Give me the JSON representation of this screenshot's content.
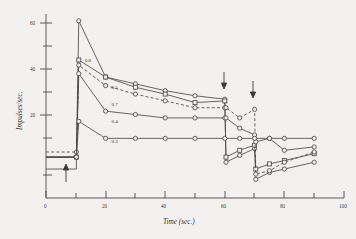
{
  "figure": {
    "kind": "scanned-scientific-plot",
    "background_color": "#f2f1ef",
    "ink_color": "#4a4a48"
  },
  "chart_data": {
    "type": "line",
    "title": "",
    "subtitle": "",
    "xlabel": "Time (sec.)",
    "ylabel": "Impulses/sec.",
    "xlim": [
      0,
      100
    ],
    "ylim": [
      8,
      62
    ],
    "grid": false,
    "legend_position": "inline-labels",
    "x_ticks_major": [
      0,
      20,
      40,
      60,
      80,
      100
    ],
    "x_ticks_minor": [
      10,
      30,
      50,
      70,
      90
    ],
    "x_tick_labels": [
      "0",
      "20",
      "40",
      "60",
      "80",
      "100"
    ],
    "y_ticks_major": [
      20,
      40,
      60
    ],
    "y_ticks_minor": [
      10,
      30,
      50
    ],
    "y_tick_labels": [
      "20",
      "40",
      "60"
    ],
    "annotations": [
      {
        "name": "stimulus-on-arrow",
        "label": "",
        "direction": "up",
        "x": 11,
        "y": 12
      },
      {
        "name": "step-down-arrow-1",
        "label": "",
        "direction": "down",
        "x": 60,
        "y": 44
      },
      {
        "name": "step-down-arrow-2",
        "label": "",
        "direction": "down",
        "x": 70,
        "y": 41
      }
    ],
    "series": [
      {
        "name": "0.8",
        "label": "0.8",
        "style": "solid",
        "marker": "circle",
        "label_x": 13,
        "label_y": 48,
        "x": [
          0,
          5,
          10.2,
          11,
          20,
          30,
          40,
          50,
          60,
          60.4,
          65,
          70,
          70.4,
          75,
          80,
          90
        ],
        "y": [
          20,
          20,
          20,
          60,
          43.5,
          41.5,
          39.5,
          38,
          37,
          18.5,
          20.5,
          22.5,
          13.5,
          15.5,
          16.5,
          18.5
        ]
      },
      {
        "name": "0.5",
        "label": "0.5",
        "style": "solid",
        "marker": "square",
        "label_x": 22,
        "label_y": 40,
        "x": [
          0,
          5,
          10.2,
          11,
          20,
          30,
          40,
          50,
          60,
          60.4,
          65,
          70,
          70.4,
          75,
          80,
          90
        ],
        "y": [
          20,
          20,
          20,
          48.5,
          43.5,
          40.5,
          38.5,
          36,
          36.5,
          20,
          22,
          23.5,
          16.5,
          18,
          19,
          21
        ]
      },
      {
        "name": "0.7",
        "label": "0.7",
        "style": "dashed",
        "marker": "circle",
        "label_x": 22,
        "label_y": 35,
        "x": [
          0,
          5,
          10.2,
          11,
          20,
          30,
          40,
          50,
          60,
          60.4,
          65,
          70,
          70.4,
          75,
          80,
          90
        ],
        "y": [
          21.5,
          21.5,
          21.5,
          47,
          41,
          38.5,
          36.5,
          34.5,
          34.5,
          34.5,
          31.5,
          34,
          15,
          16,
          18.5,
          21.5
        ]
      },
      {
        "name": "0.4",
        "label": "0.4",
        "style": "solid",
        "marker": "circle",
        "label_x": 22,
        "label_y": 30,
        "x": [
          0,
          5,
          10.2,
          11,
          20,
          30,
          40,
          50,
          60,
          60.4,
          65,
          70,
          70.4,
          75,
          80,
          90
        ],
        "y": [
          20,
          20,
          20,
          44.5,
          33.5,
          32.5,
          31.5,
          31.5,
          31.5,
          31.5,
          28.5,
          26.5,
          24.5,
          25.5,
          22,
          23
        ]
      },
      {
        "name": "0.3",
        "label": "0.3",
        "style": "solid",
        "marker": "circle",
        "label_x": 22,
        "label_y": 24,
        "x": [
          0,
          5,
          10.2,
          11,
          20,
          30,
          40,
          50,
          60,
          65,
          70,
          75,
          80,
          90
        ],
        "y": [
          20,
          20,
          20,
          30.5,
          25.5,
          25.5,
          25.5,
          25.5,
          25.5,
          25.5,
          25.5,
          25.5,
          25.5,
          25.5
        ]
      }
    ],
    "baseline": {
      "name": "pre-stimulus-baseline",
      "description": "flat low-level trace before stimulus onset",
      "x": [
        0,
        10.2
      ],
      "y": 16.5
    }
  }
}
